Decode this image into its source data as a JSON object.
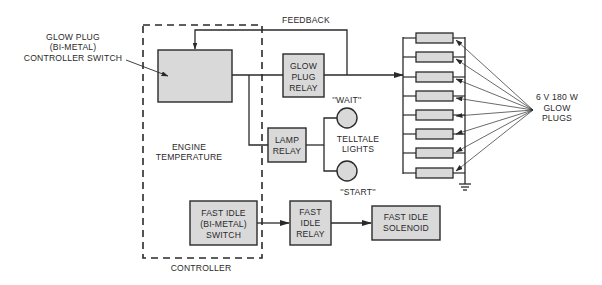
{
  "diagram": {
    "labels": {
      "feedback": "FEEDBACK",
      "controller_switch": [
        "GLOW PLUG",
        "(BI-METAL)",
        "CONTROLLER SWITCH"
      ],
      "engine_temperature": [
        "ENGINE",
        "TEMPERATURE"
      ],
      "controller": "CONTROLLER",
      "wait": "''WAIT''",
      "start": "''START''",
      "telltale_lights": [
        "TELLTALE",
        "LIGHTS"
      ],
      "glow_plugs": [
        "6 V 180 W",
        "GLOW",
        "PLUGS"
      ]
    },
    "blocks": {
      "glow_plug_relay": [
        "GLOW",
        "PLUG",
        "RELAY"
      ],
      "lamp_relay": [
        "LAMP",
        "RELAY"
      ],
      "fast_idle_switch": [
        "FAST IDLE",
        "(BI-METAL)",
        "SWITCH"
      ],
      "fast_idle_relay": [
        "FAST",
        "IDLE",
        "RELAY"
      ],
      "fast_idle_solenoid": [
        "FAST IDLE",
        "SOLENOID"
      ]
    },
    "glow_plug_count": 8,
    "colors": {
      "block_fill": "#d9d9d9",
      "line": "#2a2a2a",
      "background": "#ffffff"
    }
  }
}
